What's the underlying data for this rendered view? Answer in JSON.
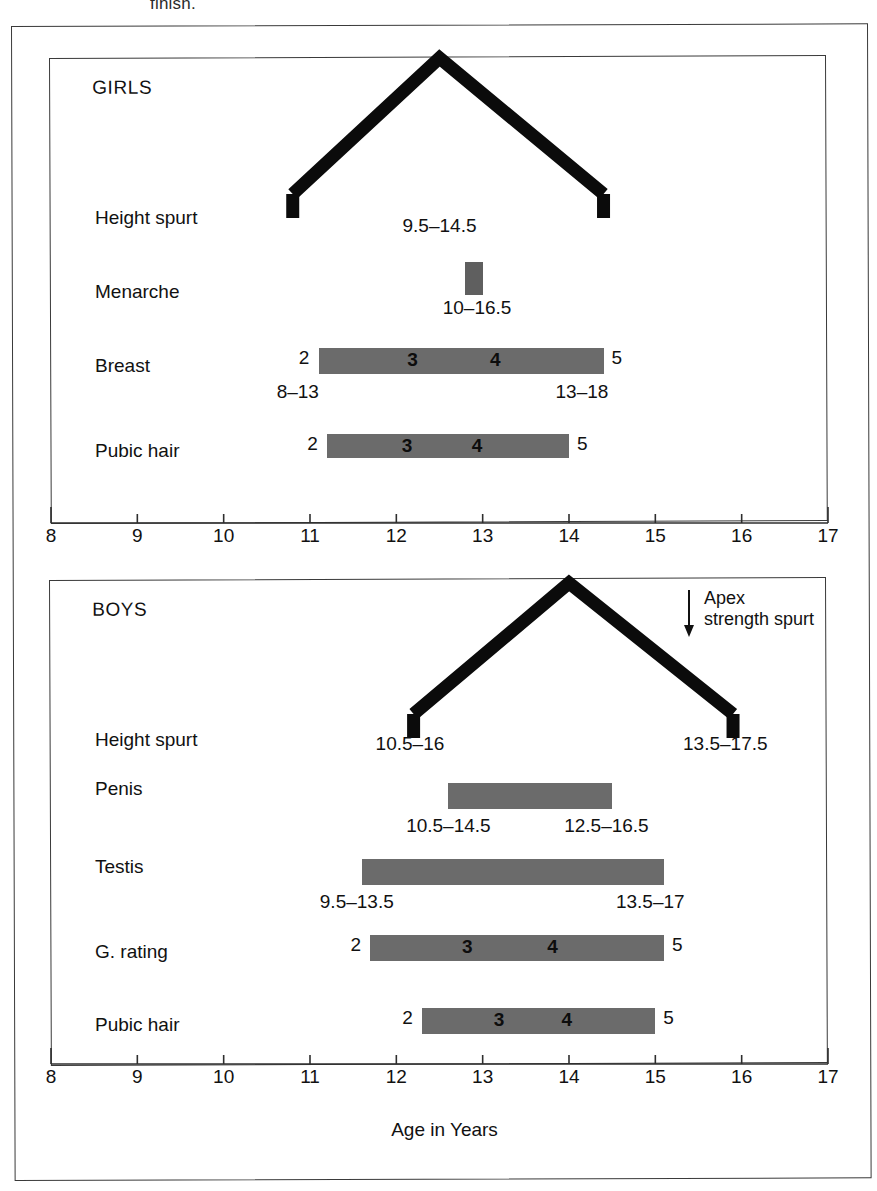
{
  "page": {
    "clipped_text": "finish.",
    "axis_caption": "Age in Years"
  },
  "axis": {
    "min": 8,
    "max": 17,
    "tick_labels": [
      "8",
      "9",
      "10",
      "11",
      "12",
      "13",
      "14",
      "15",
      "16",
      "17"
    ]
  },
  "girls": {
    "title": "GIRLS",
    "rows": {
      "height_spurt": {
        "label": "Height spurt",
        "range_text": "9.5–14.5",
        "start_age": 10.8,
        "peak_age": 12.5,
        "end_age": 14.4
      },
      "menarche": {
        "label": "Menarche",
        "range_text": "10–16.5",
        "start_age": 12.8,
        "end_age": 13.0
      },
      "breast": {
        "label": "Breast",
        "start_age": 11.1,
        "end_age": 14.4,
        "left_stage": "2",
        "right_stage": "5",
        "inner_stages": [
          "3",
          "4"
        ],
        "left_range": "8–13",
        "right_range": "13–18"
      },
      "pubic_hair": {
        "label": "Pubic hair",
        "start_age": 11.2,
        "end_age": 14.0,
        "left_stage": "2",
        "right_stage": "5",
        "inner_stages": [
          "3",
          "4"
        ]
      }
    }
  },
  "boys": {
    "title": "BOYS",
    "apex_note_line1": "Apex",
    "apex_note_line2": "strength spurt",
    "rows": {
      "height_spurt": {
        "label": "Height spurt",
        "start_age": 12.2,
        "peak_age": 14.0,
        "end_age": 15.9,
        "left_range": "10.5–16",
        "right_range": "13.5–17.5"
      },
      "penis": {
        "label": "Penis",
        "start_age": 12.6,
        "end_age": 14.5,
        "left_range": "10.5–14.5",
        "right_range": "12.5–16.5"
      },
      "testis": {
        "label": "Testis",
        "start_age": 11.6,
        "end_age": 15.1,
        "left_range": "9.5–13.5",
        "right_range": "13.5–17"
      },
      "g_rating": {
        "label": "G. rating",
        "start_age": 11.7,
        "end_age": 15.1,
        "left_stage": "2",
        "right_stage": "5",
        "inner_stages": [
          "3",
          "4"
        ]
      },
      "pubic_hair": {
        "label": "Pubic hair",
        "start_age": 12.3,
        "end_age": 15.0,
        "left_stage": "2",
        "right_stage": "5",
        "inner_stages": [
          "3",
          "4"
        ]
      }
    }
  },
  "chart_data": {
    "type": "bar",
    "xlabel": "Age in Years",
    "ylabel": "",
    "xlim": [
      8,
      17
    ],
    "grid": false,
    "legend": "none",
    "panels": [
      {
        "name": "GIRLS",
        "events": [
          {
            "label": "Height spurt",
            "type": "chevron",
            "start": 10.8,
            "peak": 12.5,
            "end": 14.4,
            "annotation": "9.5–14.5"
          },
          {
            "label": "Menarche",
            "type": "bar",
            "start": 12.8,
            "end": 13.0,
            "annotation": "10–16.5"
          },
          {
            "label": "Breast",
            "type": "bar",
            "start": 11.1,
            "end": 14.4,
            "stages": [
              "2",
              "3",
              "4",
              "5"
            ],
            "start_range": "8–13",
            "end_range": "13–18"
          },
          {
            "label": "Pubic hair",
            "type": "bar",
            "start": 11.2,
            "end": 14.0,
            "stages": [
              "2",
              "3",
              "4",
              "5"
            ]
          }
        ]
      },
      {
        "name": "BOYS",
        "events": [
          {
            "label": "Height spurt",
            "type": "chevron",
            "start": 12.2,
            "peak": 14.0,
            "end": 15.9,
            "start_range": "10.5–16",
            "end_range": "13.5–17.5",
            "annotation": "Apex strength spurt"
          },
          {
            "label": "Penis",
            "type": "bar",
            "start": 12.6,
            "end": 14.5,
            "start_range": "10.5–14.5",
            "end_range": "12.5–16.5"
          },
          {
            "label": "Testis",
            "type": "bar",
            "start": 11.6,
            "end": 15.1,
            "start_range": "9.5–13.5",
            "end_range": "13.5–17"
          },
          {
            "label": "G. rating",
            "type": "bar",
            "start": 11.7,
            "end": 15.1,
            "stages": [
              "2",
              "3",
              "4",
              "5"
            ]
          },
          {
            "label": "Pubic hair",
            "type": "bar",
            "start": 12.3,
            "end": 15.0,
            "stages": [
              "2",
              "3",
              "4",
              "5"
            ]
          }
        ]
      }
    ]
  }
}
